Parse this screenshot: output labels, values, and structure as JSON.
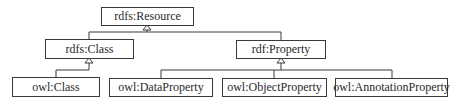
{
  "diagram": {
    "type": "uml-class-hierarchy",
    "nodes": {
      "resource": {
        "label": "rdfs:Resource"
      },
      "rdfs_class": {
        "label": "rdfs:Class"
      },
      "rdf_property": {
        "label": "rdf:Property"
      },
      "owl_class": {
        "label": "owl:Class"
      },
      "owl_data_property": {
        "label": "owl:DataProperty"
      },
      "owl_object_property": {
        "label": "owl:ObjectProperty"
      },
      "owl_annotation_property": {
        "label": "owl:AnnotationProperty"
      }
    },
    "edges": [
      {
        "from": "rdfs:Class",
        "to": "rdfs:Resource",
        "kind": "generalization"
      },
      {
        "from": "rdf:Property",
        "to": "rdfs:Resource",
        "kind": "generalization"
      },
      {
        "from": "owl:Class",
        "to": "rdfs:Class",
        "kind": "generalization"
      },
      {
        "from": "owl:DataProperty",
        "to": "rdf:Property",
        "kind": "generalization"
      },
      {
        "from": "owl:ObjectProperty",
        "to": "rdf:Property",
        "kind": "generalization"
      },
      {
        "from": "owl:AnnotationProperty",
        "to": "rdf:Property",
        "kind": "generalization"
      }
    ],
    "colors": {
      "line": "#3a3a3a",
      "background": "#ffffff"
    }
  }
}
